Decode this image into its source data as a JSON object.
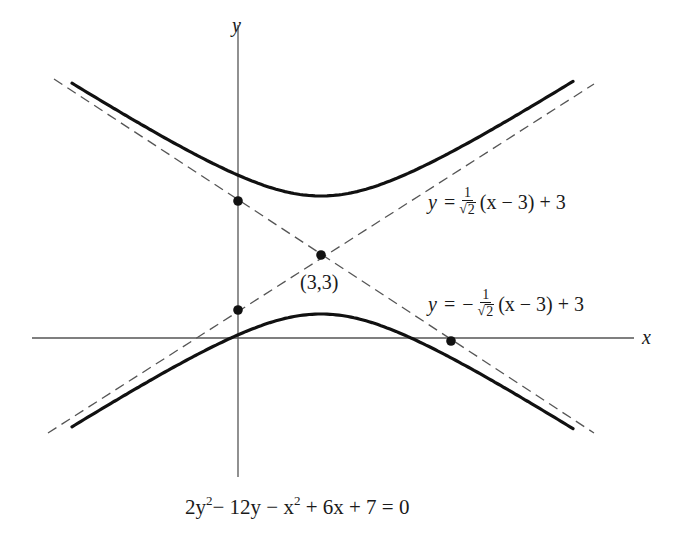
{
  "figure": {
    "axes": {
      "x_label": "x",
      "y_label": "y"
    },
    "center_point_label": "(3,3)",
    "asymptote_upper": {
      "lhs": "y",
      "equals": "=",
      "sign": "",
      "frac_num": "1",
      "frac_den_radical": "√",
      "frac_den_value": "2",
      "rest": "(x − 3) + 3"
    },
    "asymptote_lower": {
      "lhs": "y",
      "equals": "=",
      "sign": "−",
      "frac_num": "1",
      "frac_den_radical": "√",
      "frac_den_value": "2",
      "rest": "(x − 3) + 3"
    },
    "equation": {
      "part1": "2y",
      "exp1": "2",
      "part2": "− 12y − x",
      "exp2": "2",
      "part3": "+ 6x + 7 = 0"
    }
  },
  "chart_data": {
    "type": "line",
    "title": "",
    "caption": "2y² − 12y − x² + 6x + 7 = 0",
    "xlabel": "x",
    "ylabel": "y",
    "curve": "hyperbola",
    "standard_form": "(y − 3)²/2 − (x − 3)²/4 = 1",
    "center": [
      3,
      3
    ],
    "vertices": [
      [
        3,
        4.414
      ],
      [
        3,
        1.586
      ]
    ],
    "asymptotes": [
      "y = (1/√2)(x − 3) + 3",
      "y = −(1/√2)(x − 3) + 3"
    ],
    "marked_points": [
      {
        "label": "(3,3)",
        "x": 3,
        "y": 3
      },
      {
        "label": "",
        "x": 0,
        "y": 5.121
      },
      {
        "label": "",
        "x": 0,
        "y": 0.879
      },
      {
        "label": "",
        "x": 7.243,
        "y": 0
      }
    ],
    "series": [
      {
        "name": "upper branch",
        "style": "solid thick"
      },
      {
        "name": "lower branch",
        "style": "solid thick"
      },
      {
        "name": "asymptote +",
        "style": "dashed"
      },
      {
        "name": "asymptote −",
        "style": "dashed"
      }
    ],
    "grid": false,
    "legend": "none"
  },
  "colors": {
    "ink": "#1a1a1a",
    "axis": "#555555",
    "dashed": "#555555",
    "background": "#ffffff"
  }
}
